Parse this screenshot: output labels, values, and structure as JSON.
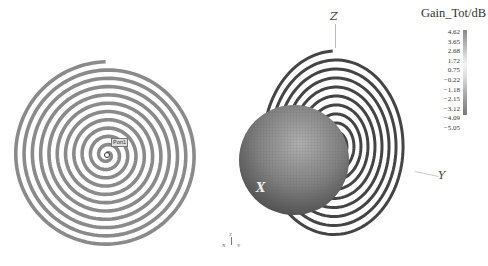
{
  "figure": {
    "left_panel": {
      "description": "spiral antenna top view",
      "port_label": "Port1"
    },
    "right_panel": {
      "description": "3D radiation pattern over spiral antenna",
      "axes": {
        "z": "Z",
        "y": "Y",
        "x": "X"
      }
    },
    "colorbar": {
      "title": "Gain_Tot/dB",
      "ticks": [
        "4.62",
        "3.65",
        "2.68",
        "1.72",
        "0.75",
        "−0.22",
        "−1.18",
        "−2.15",
        "−3.12",
        "−4.09",
        "−5.05"
      ]
    },
    "triad": {
      "z": "Z",
      "x": "X",
      "y": "Y"
    }
  }
}
